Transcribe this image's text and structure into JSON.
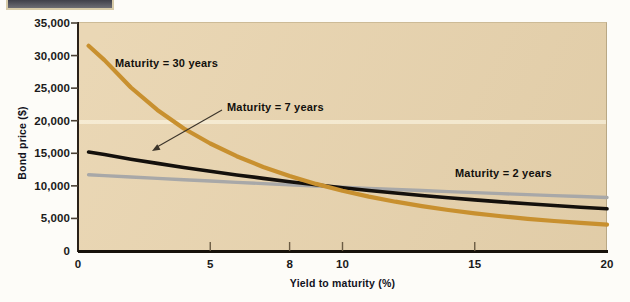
{
  "figure": {
    "title_bar_present": true,
    "panel_bg_color": "#e8d3ad"
  },
  "axes": {
    "y": {
      "label": "Bond price ($)",
      "ticks": [
        "35,000",
        "30,000",
        "25,000",
        "20,000",
        "15,000",
        "10,000",
        "5,000",
        "0"
      ],
      "tick_values": [
        35000,
        30000,
        25000,
        20000,
        15000,
        10000,
        5000,
        0
      ],
      "min": 0,
      "max": 35000
    },
    "x": {
      "label": "Yield to maturity (%)",
      "ticks": [
        "0",
        "5",
        "8",
        "10",
        "15",
        "20"
      ],
      "tick_values": [
        0,
        5,
        8,
        10,
        15,
        20
      ],
      "min": 0,
      "max": 20
    }
  },
  "annotations": {
    "maturity_30": "Maturity = 30 years",
    "maturity_7": "Maturity = 7 years",
    "maturity_2": "Maturity = 2 years"
  },
  "colors": {
    "maturity_30": "#c8902f",
    "maturity_7": "#14100c",
    "maturity_2": "#a8a8a8",
    "panel": "#e8d3ad",
    "axis": "#17120b"
  },
  "chart_data": {
    "type": "line",
    "title": "",
    "subtitle": "",
    "xlabel": "Yield to maturity (%)",
    "ylabel": "Bond price ($)",
    "xlim": [
      0,
      20
    ],
    "ylim": [
      0,
      35000
    ],
    "grid": false,
    "legend_position": "inline-annotations",
    "x": [
      0.4,
      1,
      2,
      3,
      4,
      5,
      6,
      7,
      8,
      9,
      10,
      11,
      12,
      13,
      14,
      15,
      16,
      17,
      18,
      19,
      20
    ],
    "series": [
      {
        "name": "Maturity = 30 years",
        "color": "#c8902f",
        "values": [
          31500,
          29300,
          25100,
          21650,
          18800,
          16500,
          14550,
          12900,
          11500,
          10300,
          9250,
          8350,
          7570,
          6890,
          6300,
          5780,
          5330,
          4940,
          4600,
          4310,
          4060
        ]
      },
      {
        "name": "Maturity = 7 years",
        "color": "#14100c",
        "values": [
          15200,
          14800,
          14100,
          13450,
          12830,
          12240,
          11680,
          11150,
          10640,
          10170,
          9720,
          9300,
          8900,
          8530,
          8180,
          7850,
          7540,
          7250,
          6980,
          6720,
          6480
        ]
      },
      {
        "name": "Maturity = 2 years",
        "color": "#a8a8a8",
        "values": [
          11700,
          11570,
          11360,
          11150,
          10940,
          10740,
          10540,
          10350,
          10160,
          9980,
          9800,
          9620,
          9450,
          9280,
          9120,
          8960,
          8800,
          8650,
          8500,
          8360,
          8220
        ]
      }
    ],
    "annotations": [
      {
        "text": "Maturity = 30 years",
        "x_px": 115,
        "y_px": 57
      },
      {
        "text": "Maturity = 7 years",
        "x_px": 227,
        "y_px": 101,
        "arrow_to_x_px": 152,
        "arrow_to_y_px": 151
      },
      {
        "text": "Maturity = 2 years",
        "x_px": 455,
        "y_px": 167
      }
    ]
  }
}
